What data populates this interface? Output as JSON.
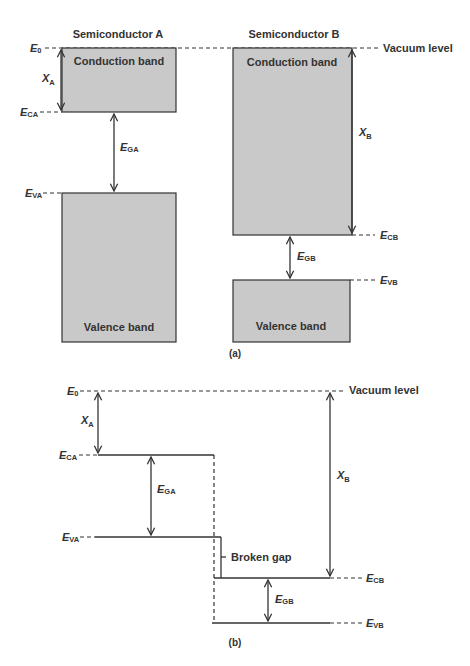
{
  "figure": {
    "panel_a": {
      "caption": "(a)",
      "semiconductor_a": {
        "title": "Semiconductor A",
        "conduction_band": "Conduction band",
        "valence_band": "Valence band"
      },
      "semiconductor_b": {
        "title": "Semiconductor B",
        "conduction_band": "Conduction band",
        "valence_band": "Valence band"
      },
      "vacuum_level": "Vacuum level"
    },
    "panel_b": {
      "caption": "(b)",
      "vacuum_level": "Vacuum level",
      "broken_gap": "Broken gap"
    },
    "labels": {
      "E0": {
        "main": "E",
        "sub": "0"
      },
      "ECA": {
        "main": "E",
        "sub": "CA"
      },
      "EVA": {
        "main": "E",
        "sub": "VA"
      },
      "EGA": {
        "main": "E",
        "sub": "GA"
      },
      "ECB": {
        "main": "E",
        "sub": "CB"
      },
      "EVB": {
        "main": "E",
        "sub": "VB"
      },
      "EGB": {
        "main": "E",
        "sub": "GB"
      },
      "chiA": {
        "main": "X",
        "sub": "A"
      },
      "chiB": {
        "main": "X",
        "sub": "B"
      }
    },
    "colors": {
      "band_fill": "#c9c9c9",
      "line": "#333333"
    }
  }
}
